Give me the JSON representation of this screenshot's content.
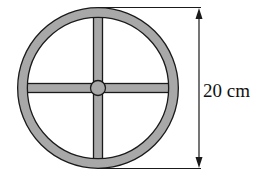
{
  "diagram": {
    "dimension_label": "20 cm",
    "dimension_value": 20,
    "dimension_unit": "cm",
    "colors": {
      "fill": "#a8a8a8",
      "stroke": "#1a1a1a"
    }
  }
}
